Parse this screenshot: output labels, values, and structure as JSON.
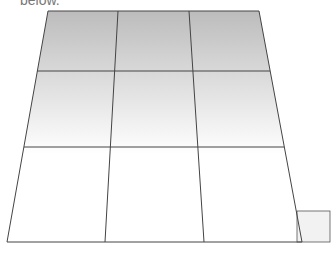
{
  "caption": "below.",
  "diagram": {
    "type": "perspective-grid",
    "rows": 3,
    "cols": 3,
    "gradient": {
      "top_color": "#bcbcbc",
      "bottom_color": "#ffffff"
    },
    "line_color": "#444444",
    "small_square": {
      "fill": "#f2f2f2",
      "stroke": "#555555"
    }
  }
}
